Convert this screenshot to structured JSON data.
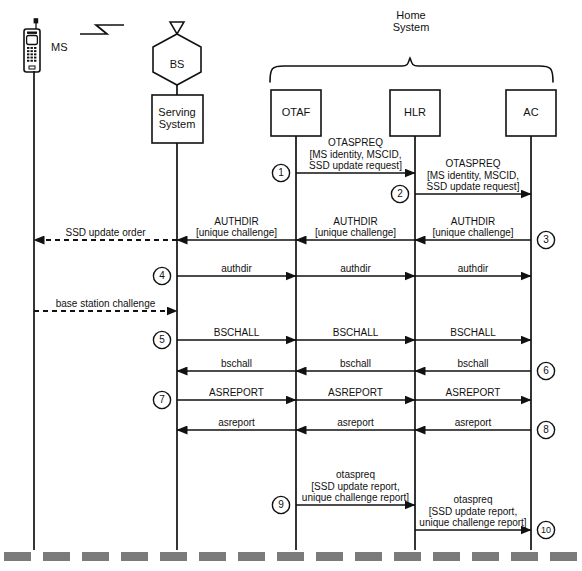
{
  "diagram": {
    "type": "sequence-diagram",
    "group_label_line1": "Home",
    "group_label_line2": "System",
    "lifelines": [
      {
        "id": "ms",
        "label": "MS",
        "x": 34,
        "icon": "mobile-station-icon",
        "shape": "phone"
      },
      {
        "id": "bs",
        "label": "BS",
        "x": 177,
        "icon": "base-station-icon",
        "shape": "hexagon"
      },
      {
        "id": "ss",
        "label_line1": "Serving",
        "label_line2": "System",
        "x": 177,
        "shape": "box"
      },
      {
        "id": "otaf",
        "label": "OTAF",
        "x": 296,
        "shape": "box"
      },
      {
        "id": "hlr",
        "label": "HLR",
        "x": 415,
        "shape": "box"
      },
      {
        "id": "ac",
        "label": "AC",
        "x": 531,
        "shape": "box"
      }
    ],
    "radio_link_icon": "radio-zigzag-icon",
    "messages": [
      {
        "step": "1",
        "label": "OTASPREQ",
        "sub": "[MS identity, MSCID,\nSSD update request]",
        "from": "otaf",
        "to": "hlr",
        "dir": "right",
        "style": "solid",
        "y": 173,
        "step_side": "left"
      },
      {
        "step": "2",
        "label": "OTASPREQ",
        "sub": "[MS identity, MSCID,\nSSD update request]",
        "from": "hlr",
        "to": "ac",
        "dir": "right",
        "style": "solid",
        "y": 194,
        "step_side": "left"
      },
      {
        "step": "3",
        "label": "AUTHDIR",
        "sub": "[unique challenge]",
        "from": "ac",
        "to": "hlr",
        "dir": "left",
        "style": "solid",
        "y": 240,
        "step_side": "right"
      },
      {
        "step": "",
        "label": "AUTHDIR",
        "sub": "[unique challenge]",
        "from": "hlr",
        "to": "otaf",
        "dir": "left",
        "style": "solid",
        "y": 240
      },
      {
        "step": "",
        "label": "AUTHDIR",
        "sub": "[unique challenge]",
        "from": "otaf",
        "to": "ss",
        "dir": "left",
        "style": "solid",
        "y": 240
      },
      {
        "step": "",
        "label": "SSD update order",
        "sub": "",
        "from": "ss",
        "to": "ms",
        "dir": "left",
        "style": "dashed",
        "y": 240
      },
      {
        "step": "4",
        "label": "authdir",
        "sub": "",
        "from": "ss",
        "to": "otaf",
        "dir": "right",
        "style": "solid",
        "y": 276,
        "step_side": "left"
      },
      {
        "step": "",
        "label": "authdir",
        "sub": "",
        "from": "otaf",
        "to": "hlr",
        "dir": "right",
        "style": "solid",
        "y": 276
      },
      {
        "step": "",
        "label": "authdir",
        "sub": "",
        "from": "hlr",
        "to": "ac",
        "dir": "right",
        "style": "solid",
        "y": 276
      },
      {
        "step": "",
        "label": "base station challenge",
        "sub": "",
        "from": "ms",
        "to": "ss",
        "dir": "right",
        "style": "dashed",
        "y": 311
      },
      {
        "step": "5",
        "label": "BSCHALL",
        "sub": "",
        "from": "ss",
        "to": "otaf",
        "dir": "right",
        "style": "solid",
        "y": 340,
        "step_side": "left"
      },
      {
        "step": "",
        "label": "BSCHALL",
        "sub": "",
        "from": "otaf",
        "to": "hlr",
        "dir": "right",
        "style": "solid",
        "y": 340
      },
      {
        "step": "",
        "label": "BSCHALL",
        "sub": "",
        "from": "hlr",
        "to": "ac",
        "dir": "right",
        "style": "solid",
        "y": 340
      },
      {
        "step": "6",
        "label": "bschall",
        "sub": "",
        "from": "ac",
        "to": "hlr",
        "dir": "left",
        "style": "solid",
        "y": 371,
        "step_side": "right"
      },
      {
        "step": "",
        "label": "bschall",
        "sub": "",
        "from": "hlr",
        "to": "otaf",
        "dir": "left",
        "style": "solid",
        "y": 371
      },
      {
        "step": "",
        "label": "bschall",
        "sub": "",
        "from": "otaf",
        "to": "ss",
        "dir": "left",
        "style": "solid",
        "y": 371
      },
      {
        "step": "7",
        "label": "ASREPORT",
        "sub": "",
        "from": "ss",
        "to": "otaf",
        "dir": "right",
        "style": "solid",
        "y": 400,
        "step_side": "left"
      },
      {
        "step": "",
        "label": "ASREPORT",
        "sub": "",
        "from": "otaf",
        "to": "hlr",
        "dir": "right",
        "style": "solid",
        "y": 400
      },
      {
        "step": "",
        "label": "ASREPORT",
        "sub": "",
        "from": "hlr",
        "to": "ac",
        "dir": "right",
        "style": "solid",
        "y": 400
      },
      {
        "step": "8",
        "label": "asreport",
        "sub": "",
        "from": "ac",
        "to": "hlr",
        "dir": "left",
        "style": "solid",
        "y": 430,
        "step_side": "right"
      },
      {
        "step": "",
        "label": "asreport",
        "sub": "",
        "from": "hlr",
        "to": "otaf",
        "dir": "left",
        "style": "solid",
        "y": 430
      },
      {
        "step": "",
        "label": "asreport",
        "sub": "",
        "from": "otaf",
        "to": "ss",
        "dir": "left",
        "style": "solid",
        "y": 430
      },
      {
        "step": "9",
        "label": "otaspreq",
        "sub": "[SSD update report,\nunique challenge report]",
        "from": "otaf",
        "to": "hlr",
        "dir": "right",
        "style": "solid",
        "y": 505,
        "step_side": "left"
      },
      {
        "step": "10",
        "label": "otaspreq",
        "sub": "[SSD update report,\nunique challenge report]",
        "from": "hlr",
        "to": "ac",
        "dir": "right",
        "style": "solid",
        "y": 530,
        "step_side": "right"
      }
    ],
    "colors": {
      "stroke": "#111111",
      "bottom_strip": "#7b7b7b",
      "background": "#ffffff"
    }
  }
}
